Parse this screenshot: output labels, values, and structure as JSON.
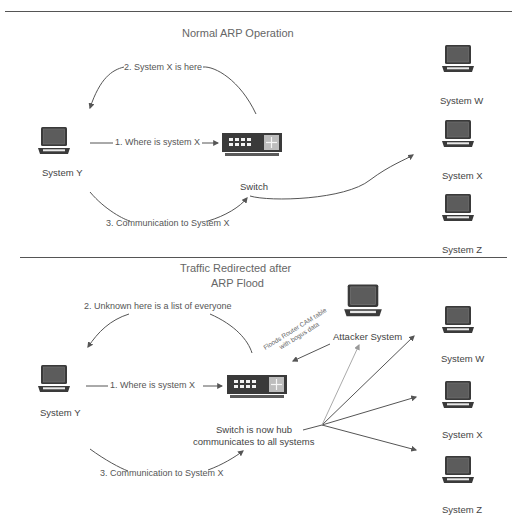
{
  "diagram": {
    "top_panel": {
      "title": "Normal ARP Operation",
      "nodes": {
        "system_y": "System Y",
        "switch": "Switch",
        "system_w": "System W",
        "system_x": "System X",
        "system_z": "System Z"
      },
      "arrows": {
        "step1": "1. Where is system X",
        "step2": "2. System X is here",
        "step3": "3. Communication to System X"
      }
    },
    "bottom_panel": {
      "title_line1": "Traffic Redirected after",
      "title_line2": "ARP Flood",
      "nodes": {
        "system_y": "System Y",
        "switch_line1": "Switch is now hub",
        "switch_line2": "communicates to all systems",
        "attacker": "Attacker System",
        "system_w": "System W",
        "system_x": "System X",
        "system_z": "System Z"
      },
      "arrows": {
        "step1": "1. Where is system X",
        "step2": "2. Unknown here is a list of everyone",
        "step3": "3. Communication to System X",
        "flood_line1": "Floods Router CAM table",
        "flood_line2": "with bogus data"
      }
    },
    "colors": {
      "device_dark": "#3a3a3a",
      "screen": "#5a5a5a",
      "switch_panel": "#bdbdbd",
      "line": "#555555",
      "faint_line": "#aaaaaa"
    }
  }
}
